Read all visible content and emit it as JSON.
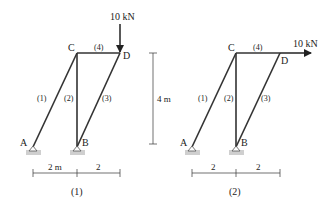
{
  "figures": [
    {
      "caption": "(1)",
      "nodes": {
        "A": "A",
        "B": "B",
        "C": "C",
        "D": "D"
      },
      "members": [
        "(1)",
        "(2)",
        "(3)",
        "(4)"
      ],
      "load": {
        "label": "10 kN",
        "direction": "down",
        "at": "D"
      },
      "dims": {
        "left": "2 m",
        "right": "2"
      }
    },
    {
      "caption": "(2)",
      "nodes": {
        "A": "A",
        "B": "B",
        "C": "C",
        "D": "D"
      },
      "members": [
        "(1)",
        "(2)",
        "(3)",
        "(4)"
      ],
      "load": {
        "label": "10 kN",
        "direction": "right",
        "at": "D"
      },
      "dims": {
        "left": "2",
        "right": "2"
      }
    }
  ],
  "height_dim": "4 m",
  "colors": {
    "member": "#333333",
    "support": "#cfcfcf",
    "text": "#222222"
  }
}
